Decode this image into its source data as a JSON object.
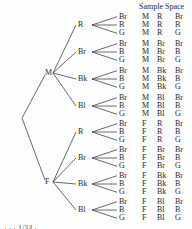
{
  "header": {
    "sample_space_title": "Sample Space"
  },
  "tree": {
    "root": "",
    "level1": [
      "M",
      "F"
    ],
    "level2": [
      "R",
      "Br",
      "Bk",
      "Bl"
    ],
    "level3": [
      "Br",
      "B",
      "G"
    ]
  },
  "sample_space": [
    [
      "M",
      "R",
      "Br"
    ],
    [
      "M",
      "R",
      "B"
    ],
    [
      "M",
      "R",
      "G"
    ],
    [
      "M",
      "Br",
      "Br"
    ],
    [
      "M",
      "Br",
      "B"
    ],
    [
      "M",
      "Br",
      "G"
    ],
    [
      "M",
      "Bk",
      "Br"
    ],
    [
      "M",
      "Bk",
      "B"
    ],
    [
      "M",
      "Bk",
      "G"
    ],
    [
      "M",
      "Bl",
      "Br"
    ],
    [
      "M",
      "Bl",
      "B"
    ],
    [
      "M",
      "Bl",
      "G"
    ],
    [
      "F",
      "R",
      "Br"
    ],
    [
      "F",
      "R",
      "B"
    ],
    [
      "F",
      "R",
      "G"
    ],
    [
      "F",
      "Br",
      "Br"
    ],
    [
      "F",
      "Br",
      "B"
    ],
    [
      "F",
      "Br",
      "G"
    ],
    [
      "F",
      "Bk",
      "Br"
    ],
    [
      "F",
      "Bk",
      "B"
    ],
    [
      "F",
      "Bk",
      "G"
    ],
    [
      "F",
      "Bl",
      "Br"
    ],
    [
      "F",
      "Bl",
      "B"
    ],
    [
      "F",
      "Bl",
      "G"
    ]
  ],
  "footer": {
    "partial_text": "· · · 1/24 ·"
  },
  "colors": {
    "ink": "#2a2a2a",
    "line": "#444444",
    "background": "#fdfdfd"
  }
}
